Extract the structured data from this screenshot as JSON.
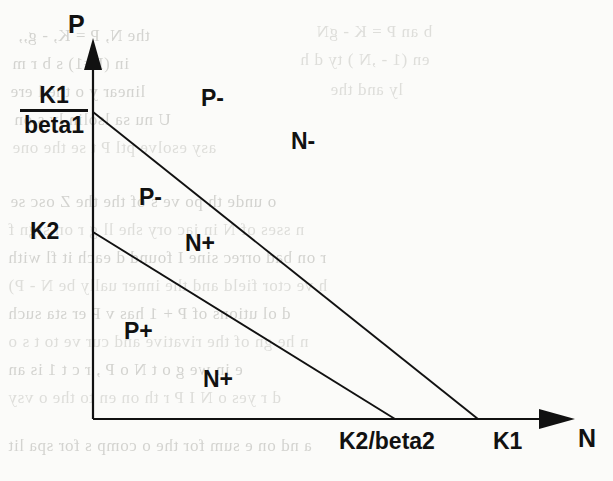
{
  "figure": {
    "background_color": "#fbfbf9",
    "line_color": "#111111"
  },
  "axes": {
    "y_axis_label": "P",
    "x_axis_label": "N",
    "origin": {
      "x": 93,
      "y": 419
    },
    "y_axis_top": 38,
    "x_axis_right": 575
  },
  "y_ticks": [
    {
      "label_numerator": "K1",
      "label_denominator": "beta1",
      "is_fraction": true,
      "y": 112
    },
    {
      "label": "K2",
      "is_fraction": false,
      "y": 232
    }
  ],
  "x_ticks": [
    {
      "label": "K2/beta2",
      "x": 395
    },
    {
      "label": "K1",
      "x": 478
    }
  ],
  "nullclines": [
    {
      "name": "P-nullcline",
      "from_label": "K1/beta1",
      "to_label": "K1",
      "x1": 93,
      "y1": 112,
      "x2": 478,
      "y2": 419
    },
    {
      "name": "N-nullcline",
      "from_label": "K2",
      "to_label": "K2/beta2",
      "x1": 93,
      "y1": 232,
      "x2": 395,
      "y2": 419
    }
  ],
  "region_labels": [
    {
      "text": "P-",
      "x": 201,
      "y": 85
    },
    {
      "text": "N-",
      "x": 291,
      "y": 128
    },
    {
      "text": "P-",
      "x": 139,
      "y": 184
    },
    {
      "text": "N+",
      "x": 185,
      "y": 230
    },
    {
      "text": "P+",
      "x": 124,
      "y": 318
    },
    {
      "text": "N+",
      "x": 203,
      "y": 366
    }
  ],
  "bleed_text": [
    {
      "text": "the N,  P = K, - g,,",
      "x": 18,
      "y": 26,
      "size": 17
    },
    {
      "text": "b an  P = K  - gN",
      "x": 316,
      "y": 22,
      "size": 17
    },
    {
      "text": "in (P=1) s  b  r  m",
      "x": 12,
      "y": 54,
      "size": 17
    },
    {
      "text": "en (1 - ,N ) ty  d h",
      "x": 300,
      "y": 50,
      "size": 17
    },
    {
      "text": "linear y  o  the  l ere",
      "x": 10,
      "y": 82,
      "size": 17
    },
    {
      "text": "ly  and  the",
      "x": 330,
      "y": 80,
      "size": 17
    },
    {
      "text": "U  nu  sa  lsolin  lv  s on",
      "x": 14,
      "y": 110,
      "size": 17
    },
    {
      "text": "asy  esolve  ptl  P  t  se  the  one",
      "x": 12,
      "y": 138,
      "size": 17
    },
    {
      "text": "o unde  th  po  ve  s of  the  the  Z  osc  se",
      "x": 10,
      "y": 192,
      "size": 17
    },
    {
      "text": "n  sses of  N  in jac  ory  she  ll g  r  on  sign  f",
      "x": 8,
      "y": 220,
      "size": 17
    },
    {
      "text": "r  on  bad  orrec  sine  I  found  d  each  it  fl  with",
      "x": 8,
      "y": 248,
      "size": 17
    },
    {
      "text": "h  ve  ctor  field  and  the  inner  ually  be  N  - P)",
      "x": 8,
      "y": 276,
      "size": 17
    },
    {
      "text": "d  ol  utions  of  P  + 1  has  v  P  er  sta  such",
      "x": 8,
      "y": 304,
      "size": 17
    },
    {
      "text": "n   he  gn  of  the  rivative  and  cur  ve  to  t  s  o",
      "x": 8,
      "y": 332,
      "size": 17
    },
    {
      "text": "e   in  we  g  o  t   N  o  P  ,  r  c  t  1  is  an",
      "x": 8,
      "y": 360,
      "size": 17
    },
    {
      "text": "d  r  yes  o  N  I  P  r  th  on   en  to   the  o  vsy",
      "x": 8,
      "y": 388,
      "size": 17
    },
    {
      "text": "a  nd  on  e  sum  for  the  o  comp  s  for  spa  lit",
      "x": 8,
      "y": 436,
      "size": 17
    }
  ]
}
